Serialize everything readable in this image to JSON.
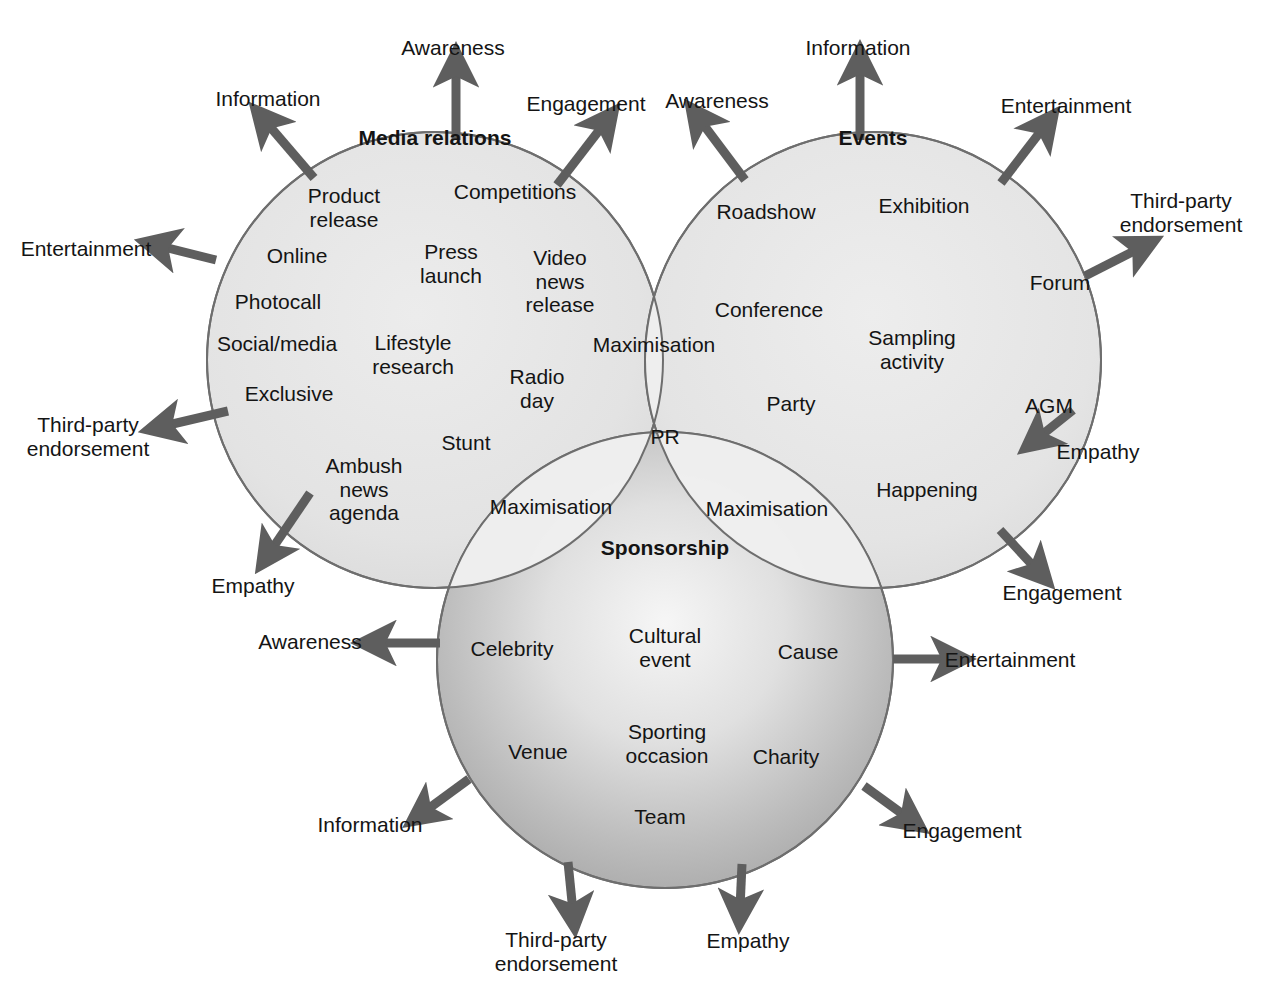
{
  "diagram": {
    "type": "venn-three-circle",
    "caption_fragment": "",
    "colors": {
      "circle_fill_light": "#e3e3e3",
      "circle_fill_mid": "#ededed",
      "sponsorship_edge": "#a8a8a8",
      "sponsorship_center": "#f2f2f2",
      "overlap_center": "#b4b4b4",
      "stroke": "#6e6e6e",
      "arrow": "#5e5e5e",
      "text": "#141414"
    },
    "circles": [
      {
        "id": "media-relations",
        "title": "Media relations",
        "cx": 435,
        "cy": 360,
        "r": 228
      },
      {
        "id": "events",
        "title": "Events",
        "cx": 873,
        "cy": 360,
        "r": 228
      },
      {
        "id": "sponsorship",
        "title": "Sponsorship",
        "cx": 665,
        "cy": 660,
        "r": 228
      }
    ],
    "center_label": "PR",
    "overlap_labels": [
      {
        "id": "overlap-media-events",
        "text": "Maximisation",
        "x": 654,
        "y": 345
      },
      {
        "id": "overlap-media-sponsorship",
        "text": "Maximisation",
        "x": 551,
        "y": 507
      },
      {
        "id": "overlap-events-sponsorship",
        "text": "Maximisation",
        "x": 767,
        "y": 509
      }
    ],
    "media_relations_items": [
      {
        "text": "Product\nrelease",
        "x": 344,
        "y": 208
      },
      {
        "text": "Competitions",
        "x": 515,
        "y": 192
      },
      {
        "text": "Online",
        "x": 297,
        "y": 256
      },
      {
        "text": "Press\nlaunch",
        "x": 451,
        "y": 264
      },
      {
        "text": "Video\nnews\nrelease",
        "x": 560,
        "y": 281
      },
      {
        "text": "Photocall",
        "x": 278,
        "y": 302
      },
      {
        "text": "Social/media",
        "x": 277,
        "y": 344
      },
      {
        "text": "Lifestyle\nresearch",
        "x": 413,
        "y": 355
      },
      {
        "text": "Radio\nday",
        "x": 537,
        "y": 389
      },
      {
        "text": "Exclusive",
        "x": 289,
        "y": 394
      },
      {
        "text": "Stunt",
        "x": 466,
        "y": 443
      },
      {
        "text": "Ambush\nnews\nagenda",
        "x": 364,
        "y": 489
      }
    ],
    "events_items": [
      {
        "text": "Roadshow",
        "x": 766,
        "y": 212
      },
      {
        "text": "Exhibition",
        "x": 924,
        "y": 206
      },
      {
        "text": "Conference",
        "x": 769,
        "y": 310
      },
      {
        "text": "Forum",
        "x": 1060,
        "y": 283
      },
      {
        "text": "Sampling\nactivity",
        "x": 912,
        "y": 350
      },
      {
        "text": "Party",
        "x": 791,
        "y": 404
      },
      {
        "text": "AGM",
        "x": 1049,
        "y": 406
      },
      {
        "text": "Happening",
        "x": 927,
        "y": 490
      }
    ],
    "sponsorship_items": [
      {
        "text": "Celebrity",
        "x": 512,
        "y": 649
      },
      {
        "text": "Cultural\nevent",
        "x": 665,
        "y": 648
      },
      {
        "text": "Cause",
        "x": 808,
        "y": 652
      },
      {
        "text": "Venue",
        "x": 538,
        "y": 752
      },
      {
        "text": "Sporting\noccasion",
        "x": 667,
        "y": 744
      },
      {
        "text": "Charity",
        "x": 786,
        "y": 757
      },
      {
        "text": "Team",
        "x": 660,
        "y": 817
      }
    ],
    "arrows": [
      {
        "id": "mr-awareness",
        "label": "Awareness",
        "lx": 453,
        "ly": 48,
        "x1": 456,
        "y1": 140,
        "x2": 456,
        "y2": 68,
        "from": "media-relations"
      },
      {
        "id": "mr-information",
        "label": "Information",
        "lx": 268,
        "ly": 99,
        "x1": 314,
        "y1": 178,
        "x2": 266,
        "y2": 122,
        "from": "media-relations"
      },
      {
        "id": "mr-entertainment",
        "label": "Entertainment",
        "lx": 86,
        "ly": 249,
        "x1": 216,
        "y1": 260,
        "x2": 160,
        "y2": 246,
        "from": "media-relations"
      },
      {
        "id": "mr-thirdparty",
        "label": "Third-party\nendorsement",
        "lx": 88,
        "ly": 437,
        "x1": 228,
        "y1": 411,
        "x2": 164,
        "y2": 426,
        "from": "media-relations"
      },
      {
        "id": "mr-empathy",
        "label": "Empathy",
        "lx": 253,
        "ly": 586,
        "x1": 310,
        "y1": 493,
        "x2": 270,
        "y2": 552,
        "from": "media-relations"
      },
      {
        "id": "mr-engagement",
        "label": "Engagement",
        "lx": 586,
        "ly": 104,
        "x1": 557,
        "y1": 185,
        "x2": 604,
        "y2": 124,
        "from": "media-relations"
      },
      {
        "id": "ev-awareness",
        "label": "Awareness",
        "lx": 717,
        "ly": 101,
        "x1": 745,
        "y1": 180,
        "x2": 700,
        "y2": 120,
        "from": "events"
      },
      {
        "id": "ev-information",
        "label": "Information",
        "lx": 858,
        "ly": 48,
        "x1": 860,
        "y1": 140,
        "x2": 860,
        "y2": 66,
        "from": "events"
      },
      {
        "id": "ev-entertainment",
        "label": "Entertainment",
        "lx": 1066,
        "ly": 106,
        "x1": 1001,
        "y1": 183,
        "x2": 1044,
        "y2": 127,
        "from": "events"
      },
      {
        "id": "ev-thirdparty",
        "label": "Third-party\nendorsement",
        "lx": 1181,
        "ly": 213,
        "x1": 1085,
        "y1": 276,
        "x2": 1140,
        "y2": 248,
        "from": "events"
      },
      {
        "id": "ev-empathy",
        "label": "Empathy",
        "lx": 1098,
        "ly": 452,
        "x1": 1073,
        "y1": 410,
        "x2": 1038,
        "y2": 438,
        "from": "events"
      },
      {
        "id": "ev-engagement",
        "label": "Engagement",
        "lx": 1062,
        "ly": 593,
        "x1": 1000,
        "y1": 530,
        "x2": 1037,
        "y2": 570,
        "from": "events"
      },
      {
        "id": "sp-awareness",
        "label": "Awareness",
        "lx": 310,
        "ly": 642,
        "x1": 440,
        "y1": 643,
        "x2": 377,
        "y2": 643,
        "from": "sponsorship"
      },
      {
        "id": "sp-entertainment",
        "label": "Entertainment",
        "lx": 1010,
        "ly": 660,
        "x1": 893,
        "y1": 659,
        "x2": 950,
        "y2": 659,
        "from": "sponsorship"
      },
      {
        "id": "sp-information",
        "label": "Information",
        "lx": 370,
        "ly": 825,
        "x1": 469,
        "y1": 779,
        "x2": 424,
        "y2": 812,
        "from": "sponsorship"
      },
      {
        "id": "sp-engagement",
        "label": "Engagement",
        "lx": 962,
        "ly": 831,
        "x1": 864,
        "y1": 786,
        "x2": 908,
        "y2": 818,
        "from": "sponsorship"
      },
      {
        "id": "sp-thirdparty",
        "label": "Third-party\nendorsement",
        "lx": 556,
        "ly": 952,
        "x1": 568,
        "y1": 862,
        "x2": 573,
        "y2": 912,
        "from": "sponsorship"
      },
      {
        "id": "sp-empathy",
        "label": "Empathy",
        "lx": 748,
        "ly": 941,
        "x1": 742,
        "y1": 864,
        "x2": 740,
        "y2": 908,
        "from": "sponsorship"
      }
    ]
  }
}
